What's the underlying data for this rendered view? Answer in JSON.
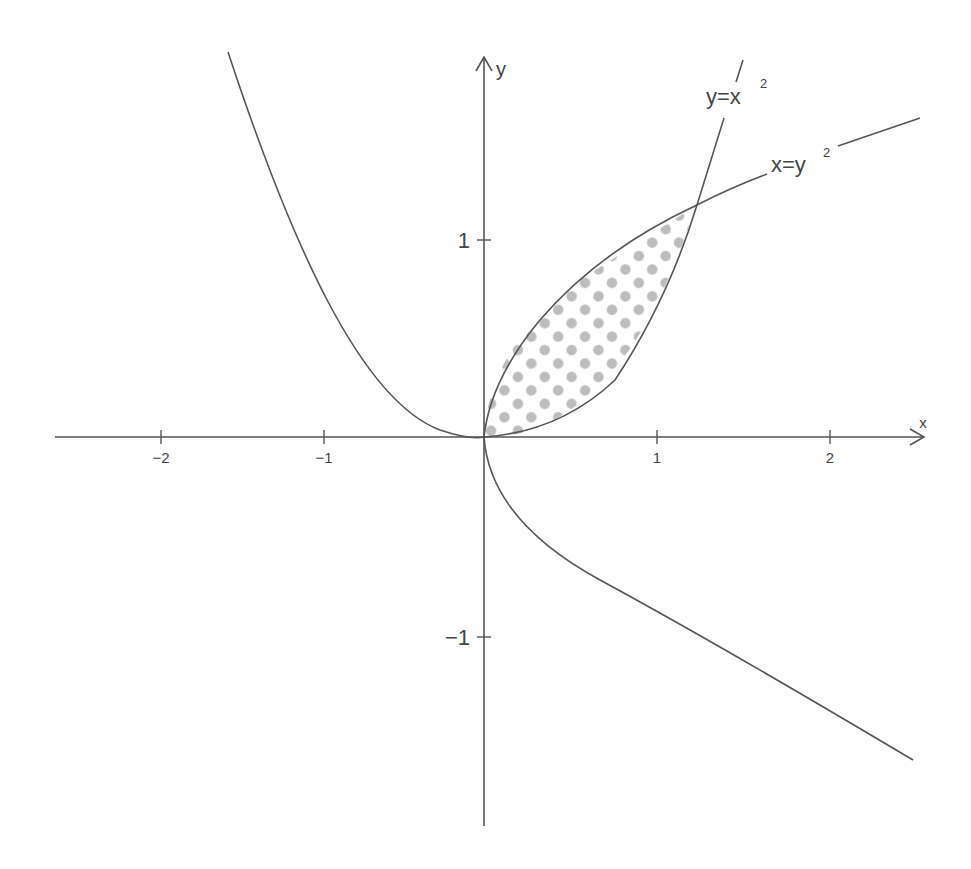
{
  "figure": {
    "axes": {
      "x_label": "x",
      "y_label": "y",
      "x_ticks": [
        {
          "value": -2,
          "label": "−2"
        },
        {
          "value": -1,
          "label": "−1"
        },
        {
          "value": 1,
          "label": "1"
        },
        {
          "value": 2,
          "label": "2"
        }
      ],
      "y_ticks": [
        {
          "value": 1,
          "label": "1"
        },
        {
          "value": -1,
          "label": "−1"
        }
      ]
    },
    "curves": [
      {
        "name": "parabola-y-eq-x2",
        "label_base": "y=x",
        "label_exp": "2",
        "equation": "y = x^2"
      },
      {
        "name": "parabola-x-eq-y2",
        "label_base": "x=y",
        "label_exp": "2",
        "equation": "x = y^2"
      }
    ],
    "shaded_region": {
      "between": [
        "y = x^2",
        "x = y^2"
      ],
      "x_range": [
        0,
        1
      ],
      "pattern": "dots",
      "pattern_color": "#bdbdbd"
    },
    "colors": {
      "line": "#555555",
      "text": "#444444",
      "dots": "#bdbdbd",
      "background": "#ffffff"
    }
  }
}
